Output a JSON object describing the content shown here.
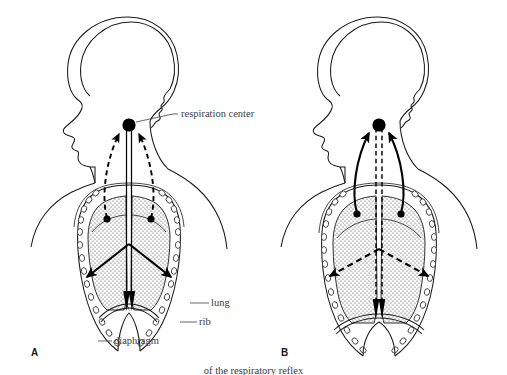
{
  "figure": {
    "background_color": "#ffffff",
    "ink_color": "#000000",
    "label_color": "#3d3d3d",
    "lung_fill_color": "#efefef",
    "stipple_color": "#555555"
  },
  "callouts": {
    "respiration_center": "respiration center",
    "lung": "lung",
    "rib": "rib",
    "diaphragm": "diaphragm"
  },
  "panels": [
    {
      "letter": "A",
      "phase": "inspiration",
      "afferent_style": "dashed",
      "efferent_style": "solid",
      "diaphragm_arrow_direction": "down"
    },
    {
      "letter": "B",
      "phase": "expiration",
      "afferent_style": "solid",
      "efferent_style": "dashed",
      "diaphragm_arrow_direction": "down"
    }
  ],
  "caption": {
    "text": "of the respiratory reflex"
  }
}
